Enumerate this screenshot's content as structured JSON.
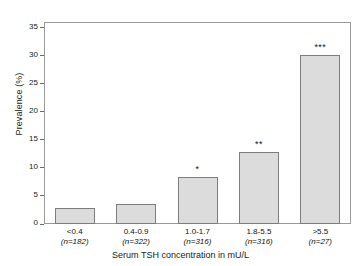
{
  "chart_data": {
    "type": "bar",
    "title": "",
    "xlabel": "Serum TSH concentration in mU/L",
    "ylabel": "Prevalence (%)",
    "categories": [
      "<0.4",
      "0.4-0.9",
      "1.0-1.7",
      "1.8-5.5",
      ">5.5"
    ],
    "group_sizes": [
      "(n=182)",
      "(n=322)",
      "(n=316)",
      "(n=316)",
      "(n=27)"
    ],
    "values": [
      2.8,
      3.5,
      8.3,
      12.8,
      30.2
    ],
    "significance": [
      "",
      "",
      "*",
      "**",
      "***"
    ],
    "ylim": [
      0,
      36
    ],
    "yticks": [
      0,
      5,
      10,
      15,
      20,
      25,
      30,
      35
    ],
    "ytick_labels": [
      "0",
      "5",
      "10",
      "15",
      "20",
      "25",
      "30",
      "35"
    ],
    "grid": false,
    "legend": "none",
    "bar_fill": "#dcdcdc",
    "bar_edge": "#7d7d7d",
    "axis_color": "#9a9a9a"
  }
}
